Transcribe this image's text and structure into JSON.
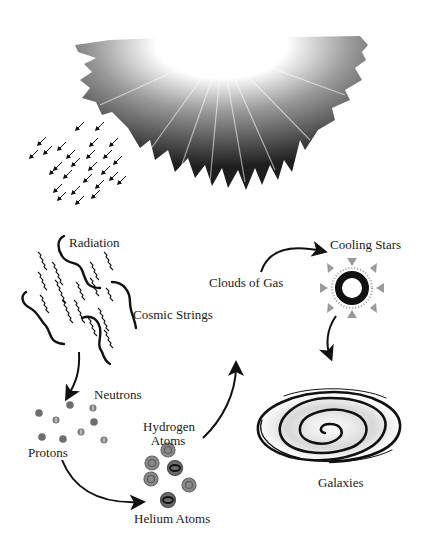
{
  "diagram": {
    "stages": [
      {
        "id": "big-bang",
        "label": ""
      },
      {
        "id": "radiation",
        "label": "Radiation"
      },
      {
        "id": "cosmic-strings",
        "label": "Cosmic Strings"
      },
      {
        "id": "neutrons",
        "label": "Neutrons"
      },
      {
        "id": "protons",
        "label": "Protons"
      },
      {
        "id": "hydrogen-atoms",
        "label": "Hydrogen\nAtoms"
      },
      {
        "id": "helium-atoms",
        "label": "Helium Atoms"
      },
      {
        "id": "clouds-of-gas",
        "label": "Clouds of Gas"
      },
      {
        "id": "cooling-stars",
        "label": "Cooling Stars"
      },
      {
        "id": "galaxies",
        "label": "Galaxies"
      }
    ],
    "labels": {
      "radiation": "Radiation",
      "cosmic_strings": "Cosmic Strings",
      "neutrons": "Neutrons",
      "protons": "Protons",
      "hydrogen_line1": "Hydrogen",
      "hydrogen_line2": "Atoms",
      "helium": "Helium Atoms",
      "clouds": "Clouds of Gas",
      "cooling_stars": "Cooling Stars",
      "galaxies": "Galaxies"
    },
    "flow": [
      "cosmic-strings -> protons/neutrons",
      "protons -> helium-atoms",
      "hydrogen-atoms -> clouds-of-gas",
      "clouds-of-gas -> cooling-stars",
      "cooling-stars -> galaxies"
    ],
    "colors": {
      "ink": "#111111",
      "particle": "#6e6e6e",
      "star_rays": "#9a9a9a"
    }
  }
}
